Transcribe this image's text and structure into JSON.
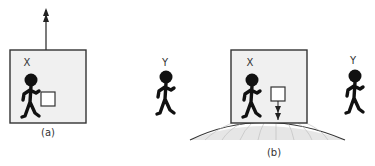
{
  "figure": {
    "panel_a": {
      "caption": "(a)",
      "person_label": "X"
    },
    "panel_b": {
      "caption": "(b)",
      "person_inside_label": "X",
      "observer_left_label": "Y",
      "observer_right_label": "Y"
    },
    "colors": {
      "box_fill": "#f0f0f0",
      "stroke": "#222222",
      "figure": "#111111",
      "ground_fill": "#e6e6e6"
    }
  }
}
